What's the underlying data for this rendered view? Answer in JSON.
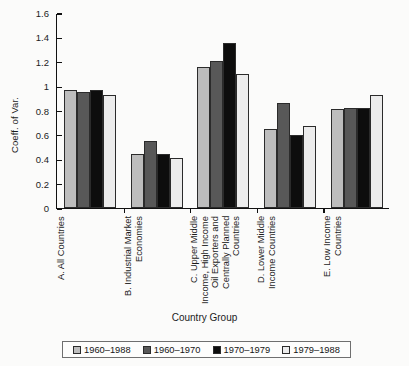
{
  "chart_data": {
    "type": "bar",
    "title": "",
    "xlabel": "Country Group",
    "ylabel": "Coeff. of Var.",
    "ylim": [
      0,
      1.6
    ],
    "yticks": [
      "0",
      "0.2",
      "0.4",
      "0.6",
      "0.8",
      "1",
      "1.2",
      "1.4",
      "1.6"
    ],
    "ytick_values": [
      0,
      0.2,
      0.4,
      0.6,
      0.8,
      1.0,
      1.2,
      1.4,
      1.6
    ],
    "grid": false,
    "legend_position": "bottom",
    "categories": [
      "A. All Countries",
      "B. Industrial Market Economies",
      "C. Upper Middle Income, High Income Oil Exporters and Centrally Planned Countries",
      "D. Lower Middle Income Countries",
      "E. Low Income Countries"
    ],
    "category_labels_display": [
      "A. All Countries",
      "B. Industrial Market\nEconomies",
      "C. Upper Middle\nIncome, High Income\nOil Exporters and\nCentrally Planned\nCountries",
      "D. Lower Middle\nIncome Countries",
      "E. Low Income\nCountries"
    ],
    "series": [
      {
        "name": "1960–1988",
        "color": "#bdbdbd",
        "values": [
          0.97,
          0.44,
          1.16,
          0.65,
          0.81
        ]
      },
      {
        "name": "1960–1970",
        "color": "#585858",
        "values": [
          0.95,
          0.55,
          1.21,
          0.86,
          0.82
        ]
      },
      {
        "name": "1970–1979",
        "color": "#0d0d0d",
        "values": [
          0.97,
          0.44,
          1.35,
          0.6,
          0.82
        ]
      },
      {
        "name": "1979–1988",
        "color": "#ececec",
        "values": [
          0.93,
          0.41,
          1.1,
          0.67,
          0.93
        ]
      }
    ]
  }
}
